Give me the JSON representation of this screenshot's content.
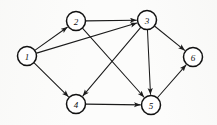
{
  "figure": {
    "background_color": "#fcfcfb",
    "stroke_color": "#1b1b1b",
    "node_fill_color": "#ffffff",
    "node_stroke_color": "#111111",
    "width": 217,
    "height": 125
  },
  "chart_data": {
    "type": "diagram",
    "diagram_type": "directed-graph",
    "directed": true,
    "node_radius": 9.5,
    "nodes": [
      {
        "id": "1",
        "label": "1",
        "x": 27,
        "y": 56
      },
      {
        "id": "2",
        "label": "2",
        "x": 76,
        "y": 21
      },
      {
        "id": "3",
        "label": "3",
        "x": 147,
        "y": 20
      },
      {
        "id": "4",
        "label": "4",
        "x": 76,
        "y": 104
      },
      {
        "id": "5",
        "label": "5",
        "x": 151,
        "y": 105
      },
      {
        "id": "6",
        "label": "6",
        "x": 193,
        "y": 57
      }
    ],
    "edges": [
      {
        "from": "1",
        "to": "2",
        "label": ""
      },
      {
        "from": "1",
        "to": "3",
        "label": ""
      },
      {
        "from": "1",
        "to": "4",
        "label": ""
      },
      {
        "from": "2",
        "to": "3",
        "label": ""
      },
      {
        "from": "2",
        "to": "5",
        "label": ""
      },
      {
        "from": "3",
        "to": "4",
        "label": ""
      },
      {
        "from": "3",
        "to": "5",
        "label": ""
      },
      {
        "from": "3",
        "to": "6",
        "label": ""
      },
      {
        "from": "4",
        "to": "5",
        "label": ""
      },
      {
        "from": "5",
        "to": "6",
        "label": ""
      }
    ],
    "node_count": 6,
    "edge_count": 10,
    "xlabel": "",
    "ylabel": "",
    "legend": []
  }
}
